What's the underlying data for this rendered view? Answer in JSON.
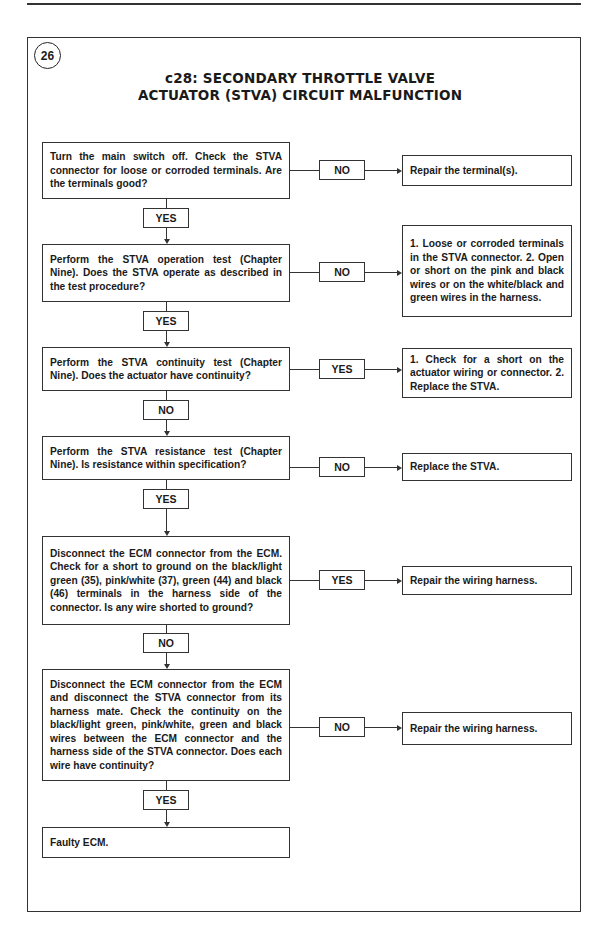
{
  "page": {
    "figure_number": "26",
    "title_line1": "c28: SECONDARY THROTTLE VALVE",
    "title_line2": "ACTUATOR (STVA) CIRCUIT MALFUNCTION"
  },
  "flowchart": {
    "steps": [
      {
        "text": "Turn the main switch off. Check the STVA connector for loose or corroded terminals. Are the terminals good?",
        "side_label": "NO",
        "side_result": "Repair the terminal(s).",
        "down_label": "YES"
      },
      {
        "text": "Perform the STVA operation test (Chapter Nine). Does the STVA operate as described in the test procedure?",
        "side_label": "NO",
        "side_result": "1. Loose or corroded terminals in the STVA connector. 2. Open or short on the pink and black wires or on the white/black and green wires in the harness.",
        "side_result_lines": [
          "1. Loose or corroded termi-",
          "nals in the STVA connector.",
          "2. Open or short on the pink",
          "and black wires or on the",
          "white/black and green wires",
          "in the harness."
        ],
        "down_label": "YES"
      },
      {
        "text": "Perform the STVA continuity test (Chapter Nine). Does the actuator have continuity?",
        "side_label": "YES",
        "side_result": "1. Check for a short on the actuator wiring or connector. 2. Replace the STVA.",
        "side_result_lines": [
          "1. Check for a short on the",
          "actuator wiring or connector.",
          "2. Replace the STVA."
        ],
        "down_label": "NO"
      },
      {
        "text": "Perform the STVA resistance test (Chapter Nine). Is resistance within specification?",
        "side_label": "NO",
        "side_result": "Replace the STVA.",
        "down_label": "YES"
      },
      {
        "text": "Disconnect the ECM connector from the ECM. Check for a short to ground on the black/light green (35), pink/white (37), green (44) and black (46) terminals in the harness side of the connector. Is any wire shorted to ground?",
        "side_label": "YES",
        "side_result": "Repair the wiring harness.",
        "down_label": "NO"
      },
      {
        "text": "Disconnect the ECM connector from the ECM and disconnect the STVA connector from its harness mate. Check the continuity on the black/light green, pink/white, green and black wires between the ECM connector and the harness side of the STVA connector. Does each wire have continuity?",
        "side_label": "NO",
        "side_result": "Repair the wiring harness.",
        "down_label": "YES"
      },
      {
        "text": "Faulty ECM."
      }
    ]
  }
}
